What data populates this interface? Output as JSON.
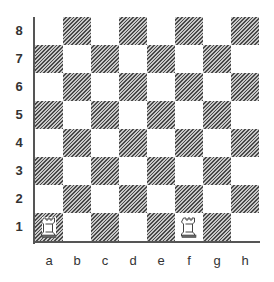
{
  "board": {
    "files": [
      "a",
      "b",
      "c",
      "d",
      "e",
      "f",
      "g",
      "h"
    ],
    "ranks": [
      "8",
      "7",
      "6",
      "5",
      "4",
      "3",
      "2",
      "1"
    ],
    "light_color": "#ffffff",
    "dark_color": "hatched-gray"
  },
  "pieces": [
    {
      "square": "a1",
      "type": "rook",
      "color": "white",
      "icon": "white-rook-icon"
    },
    {
      "square": "f1",
      "type": "rook",
      "color": "white",
      "icon": "white-rook-icon"
    }
  ]
}
